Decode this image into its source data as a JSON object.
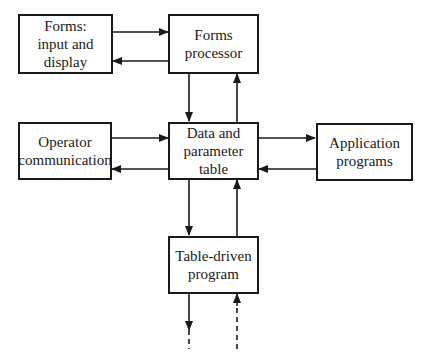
{
  "diagram": {
    "nodes": [
      {
        "id": "forms-io",
        "label": "Forms:\ninput and\ndisplay"
      },
      {
        "id": "forms-processor",
        "label": "Forms\nprocessor"
      },
      {
        "id": "operator-communication",
        "label": "Operator\ncommunication"
      },
      {
        "id": "data-table",
        "label": "Data and\nparameter\ntable"
      },
      {
        "id": "application-programs",
        "label": "Application\nprograms"
      },
      {
        "id": "table-driven-program",
        "label": "Table-driven\nprogram"
      }
    ],
    "edges": [
      {
        "from": "forms-io",
        "to": "forms-processor",
        "style": "solid"
      },
      {
        "from": "forms-processor",
        "to": "forms-io",
        "style": "solid"
      },
      {
        "from": "forms-processor",
        "to": "data-table",
        "style": "solid"
      },
      {
        "from": "data-table",
        "to": "forms-processor",
        "style": "solid"
      },
      {
        "from": "operator-communication",
        "to": "data-table",
        "style": "solid"
      },
      {
        "from": "data-table",
        "to": "operator-communication",
        "style": "solid"
      },
      {
        "from": "data-table",
        "to": "application-programs",
        "style": "solid"
      },
      {
        "from": "application-programs",
        "to": "data-table",
        "style": "solid"
      },
      {
        "from": "data-table",
        "to": "table-driven-program",
        "style": "solid"
      },
      {
        "from": "table-driven-program",
        "to": "data-table",
        "style": "solid"
      },
      {
        "from": "table-driven-program",
        "to": "(continues below)",
        "style": "solid-then-dashed"
      },
      {
        "from": "(continues below)",
        "to": "table-driven-program",
        "style": "dashed"
      }
    ]
  }
}
